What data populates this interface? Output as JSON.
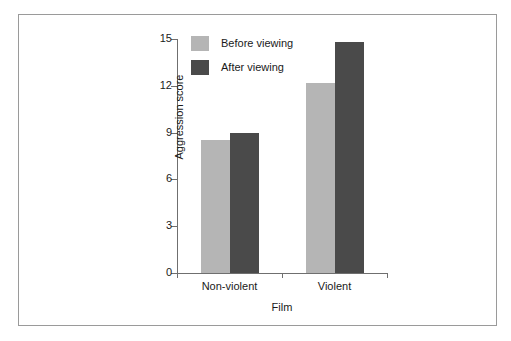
{
  "chart_data": {
    "type": "bar",
    "title": "",
    "subtitle": "",
    "xlabel": "Film",
    "ylabel": "Aggression score",
    "categories": [
      "Non-violent",
      "Violent"
    ],
    "series": [
      {
        "name": "Before viewing",
        "color": "#b5b5b5",
        "values": [
          8.5,
          12.2
        ]
      },
      {
        "name": "After viewing",
        "color": "#4a4a4a",
        "values": [
          9.0,
          14.8
        ]
      }
    ],
    "ylim": [
      0,
      15
    ],
    "yticks": [
      0,
      3,
      6,
      9,
      12,
      15
    ],
    "ytick_labels": [
      "0",
      "3",
      "6",
      "9",
      "12",
      "15"
    ],
    "xtick_labels": [
      "Non-violent",
      "Violent"
    ],
    "grid": false,
    "legend_position": "top-left-inside",
    "legend_entries": [
      "Before viewing",
      "After viewing"
    ]
  },
  "figure": {
    "border_color": "#9a9a9a",
    "background": "#ffffff",
    "axis_color": "#6f6f6f",
    "text_color": "#1a1a1a"
  }
}
